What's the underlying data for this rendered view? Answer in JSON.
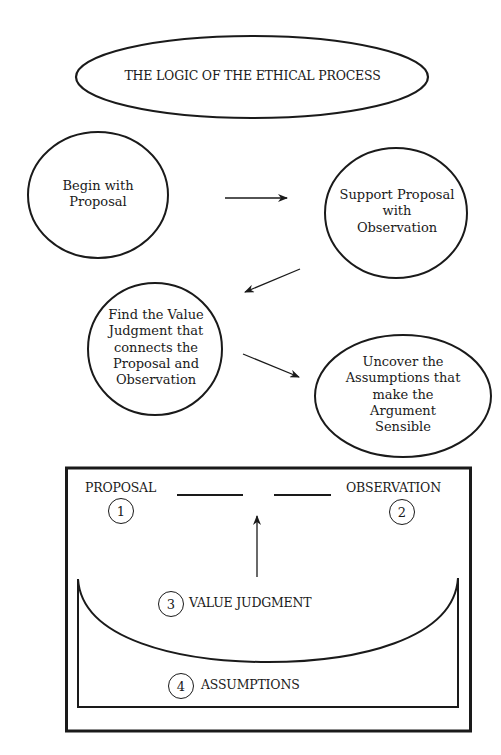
{
  "title": "THE LOGIC OF THE ETHICAL PROCESS",
  "flow_nodes": [
    {
      "id": "begin",
      "label": "Begin with\nProposal"
    },
    {
      "id": "support",
      "label": "Support Proposal\nwith\nObservation"
    },
    {
      "id": "value",
      "label": "Find the Value\nJudgment that\nconnects the\nProposal and\nObservation"
    },
    {
      "id": "assumptions",
      "label": "Uncover the\nAssumptions that\nmake the\nArgument\nSensible"
    }
  ],
  "flow_edges": [
    {
      "from": "begin",
      "to": "support"
    },
    {
      "from": "support",
      "to": "value"
    },
    {
      "from": "value",
      "to": "assumptions"
    }
  ],
  "structure_box": {
    "proposal": {
      "label": "PROPOSAL",
      "number": "1"
    },
    "observation": {
      "label": "OBSERVATION",
      "number": "2"
    },
    "value_judgment": {
      "label": "VALUE JUDGMENT",
      "number": "3"
    },
    "assumptions": {
      "label": "ASSUMPTIONS",
      "number": "4"
    }
  },
  "colors": {
    "ink": "#1a1a1a",
    "background": "#ffffff"
  }
}
